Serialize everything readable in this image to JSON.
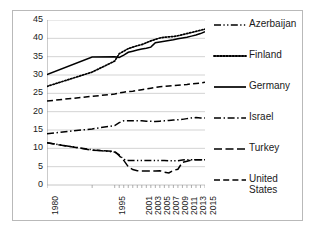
{
  "chart_data": {
    "type": "line",
    "title": "",
    "xlabel": "",
    "ylabel": "",
    "ylim": [
      0,
      45
    ],
    "yticks": [
      0,
      5,
      10,
      15,
      20,
      25,
      30,
      35,
      40,
      45
    ],
    "grid": "horizontal",
    "legend_position": "right",
    "x": [
      1980,
      1990,
      1995,
      1996,
      1997,
      1998,
      1999,
      2000,
      2001,
      2002,
      2003,
      2004,
      2005,
      2006,
      2007,
      2008,
      2009,
      2010,
      2011,
      2012,
      2013,
      2014,
      2015
    ],
    "xtick_labels": [
      "1980",
      "1995",
      "2001",
      "2003",
      "2005",
      "2007",
      "2009",
      "2011",
      "2013",
      "2015"
    ],
    "series": [
      {
        "name": "Azerbaijan",
        "style": "dash-dot-dot",
        "color": "#000000",
        "values": [
          11.5,
          9.6,
          9.0,
          8.2,
          7.0,
          6.7,
          6.7,
          6.7,
          6.7,
          6.7,
          6.7,
          6.7,
          6.7,
          6.7,
          6.6,
          6.6,
          6.6,
          6.8,
          6.9,
          6.9,
          6.9,
          6.9,
          6.9
        ]
      },
      {
        "name": "Finland",
        "style": "dotted",
        "color": "#000000",
        "values": [
          26.9,
          30.8,
          33.8,
          35.8,
          36.5,
          37.2,
          37.6,
          38.0,
          38.3,
          38.8,
          39.3,
          39.7,
          40.1,
          40.3,
          40.4,
          40.5,
          40.7,
          41.0,
          41.3,
          41.6,
          41.9,
          42.2,
          42.5
        ]
      },
      {
        "name": "Germany",
        "style": "solid",
        "color": "#000000",
        "values": [
          30.1,
          34.9,
          35.0,
          34.8,
          35.4,
          36.2,
          36.5,
          36.8,
          37.1,
          37.3,
          37.6,
          38.8,
          39.0,
          39.2,
          39.4,
          39.6,
          39.9,
          40.1,
          40.3,
          40.6,
          40.9,
          41.3,
          41.8
        ]
      },
      {
        "name": "Israel",
        "style": "dash-dot",
        "color": "#000000",
        "values": [
          14.0,
          15.3,
          16.2,
          17.0,
          17.5,
          17.5,
          17.5,
          17.5,
          17.5,
          17.4,
          17.4,
          17.3,
          17.4,
          17.5,
          17.6,
          17.7,
          17.8,
          17.9,
          18.1,
          18.3,
          18.4,
          18.3,
          18.3
        ]
      },
      {
        "name": "Turkey",
        "style": "long-dash",
        "color": "#000000",
        "values": [
          11.5,
          9.5,
          9.2,
          8.0,
          6.7,
          5.0,
          4.2,
          3.9,
          3.8,
          3.8,
          3.8,
          3.8,
          3.9,
          3.5,
          3.3,
          4.0,
          4.3,
          6.2,
          6.5,
          6.8,
          6.9,
          6.9,
          6.9
        ]
      },
      {
        "name": "United States",
        "style": "dashed",
        "color": "#000000",
        "values": [
          22.9,
          24.2,
          24.8,
          25.1,
          25.3,
          25.5,
          25.6,
          25.8,
          26.0,
          26.2,
          26.4,
          26.6,
          26.8,
          26.9,
          27.0,
          27.1,
          27.2,
          27.3,
          27.4,
          27.6,
          27.7,
          27.8,
          28.0
        ]
      }
    ]
  },
  "legend": {
    "entries": [
      {
        "label": "Azerbaijan"
      },
      {
        "label": "Finland"
      },
      {
        "label": "Germany"
      },
      {
        "label": "Israel"
      },
      {
        "label": "Turkey"
      },
      {
        "label": "United\nStates"
      }
    ]
  }
}
